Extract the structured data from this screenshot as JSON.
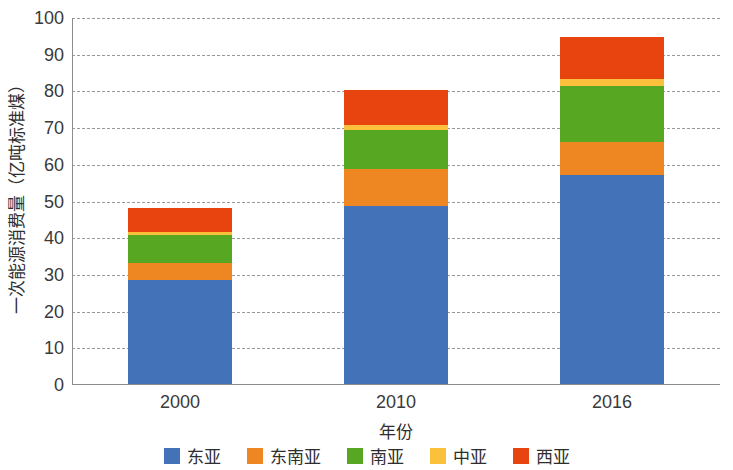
{
  "chart_data": {
    "type": "bar",
    "stacked": true,
    "title": "",
    "xlabel": "年份",
    "ylabel": "一次能源消费量（亿吨标准煤）",
    "categories": [
      "2000",
      "2010",
      "2016"
    ],
    "ylim": [
      0,
      100
    ],
    "yticks": [
      0,
      10,
      20,
      30,
      40,
      50,
      60,
      70,
      80,
      90,
      100
    ],
    "ytick_labels": [
      "0",
      "10",
      "20",
      "30",
      "40",
      "50",
      "60",
      "70",
      "80",
      "90",
      "100"
    ],
    "grid": true,
    "grid_style": "dashed-horizontal",
    "legend_position": "bottom",
    "series": [
      {
        "name": "东亚",
        "color": "#4472b8",
        "values": [
          28.3,
          48.5,
          57.0
        ]
      },
      {
        "name": "东南亚",
        "color": "#ee8722",
        "values": [
          4.7,
          10.0,
          9.0
        ]
      },
      {
        "name": "南亚",
        "color": "#57a722",
        "values": [
          7.5,
          10.7,
          15.2
        ]
      },
      {
        "name": "中亚",
        "color": "#fbc13d",
        "values": [
          0.9,
          1.3,
          1.8
        ]
      },
      {
        "name": "西亚",
        "color": "#e8440f",
        "values": [
          6.6,
          9.5,
          11.5
        ]
      }
    ],
    "totals": [
      48.0,
      80.0,
      94.5
    ]
  },
  "legend": {
    "items": [
      {
        "label": "东亚",
        "color": "#4472b8"
      },
      {
        "label": "东南亚",
        "color": "#ee8722"
      },
      {
        "label": "南亚",
        "color": "#57a722"
      },
      {
        "label": "中亚",
        "color": "#fbc13d"
      },
      {
        "label": "西亚",
        "color": "#e8440f"
      }
    ]
  }
}
